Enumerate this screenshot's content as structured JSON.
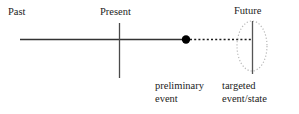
{
  "figure": {
    "width": 299,
    "height": 114,
    "background": "#ffffff"
  },
  "labels": {
    "past": "Past",
    "present": "Present",
    "future": "Future",
    "preliminary_event_line1": "preliminary",
    "preliminary_event_line2": "event",
    "targeted_line1": "targeted",
    "targeted_line2": "event/state"
  },
  "colors": {
    "ink": "#1c1c1c",
    "timeline": "#333333",
    "dot": "#000000",
    "dotted_projection": "#1a1a1a",
    "ellipse_outline": "#b9b9b9",
    "ellipse_axis": "#555555",
    "background": "#ffffff"
  },
  "geometry": {
    "timeline": {
      "x1": 20,
      "y1": 39.5,
      "x2": 186,
      "y2": 39.5,
      "stroke_width": 1.4
    },
    "present_marker": {
      "x": 119.5,
      "y1": 23,
      "y2": 78,
      "stroke_width": 1.3
    },
    "preliminary_event_dot": {
      "cx": 186,
      "cy": 39.5,
      "r": 4.2
    },
    "projection_dashed": {
      "x1": 190,
      "y1": 39.5,
      "x2": 252,
      "y2": 39.5,
      "dash": "2,2.2",
      "stroke_width": 1.3
    },
    "future_ellipse": {
      "cx": 252,
      "cy": 46,
      "rx": 15,
      "ry": 25,
      "dash": "1.2,2",
      "stroke_width": 1.2
    },
    "future_axis": {
      "x": 252.5,
      "y1": 21,
      "y2": 74,
      "stroke_width": 1.3
    }
  }
}
